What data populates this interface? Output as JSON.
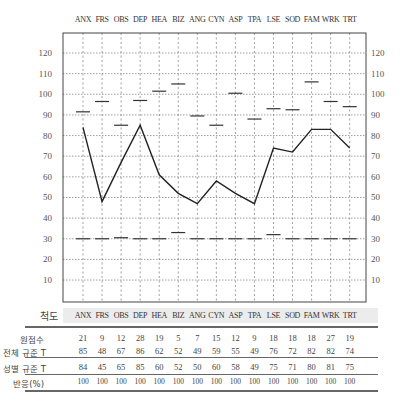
{
  "chart_data": {
    "type": "line",
    "title": "",
    "categories": [
      "ANX",
      "FRS",
      "OBS",
      "DEP",
      "HEA",
      "BIZ",
      "ANG",
      "CYN",
      "ASP",
      "TPA",
      "LSE",
      "SOD",
      "FAM",
      "WRK",
      "TRT"
    ],
    "ylim": [
      0,
      125
    ],
    "yticks": [
      10,
      20,
      30,
      40,
      50,
      60,
      70,
      80,
      90,
      100,
      110,
      120
    ],
    "grid": true,
    "series": [
      {
        "name": "profile line (T)",
        "style": "line",
        "values": [
          84,
          48,
          67,
          85,
          61,
          52,
          47,
          58,
          52,
          47,
          74,
          72,
          83,
          83,
          74
        ]
      },
      {
        "name": "upper markers",
        "style": "dash",
        "values": [
          91.5,
          96.5,
          85,
          97,
          101.5,
          105,
          89.5,
          85,
          100.5,
          88,
          93,
          92.5,
          106,
          96.5,
          94
        ]
      },
      {
        "name": "lower markers",
        "style": "dash",
        "values": [
          30,
          30,
          30.5,
          30,
          30,
          33,
          30,
          30,
          30,
          30,
          32,
          30,
          30,
          30,
          30
        ]
      }
    ]
  },
  "scale_row": {
    "label": "척도",
    "items": [
      "ANX",
      "FRS",
      "OBS",
      "DEP",
      "HEA",
      "BIZ",
      "ANG",
      "CYN",
      "ASP",
      "TPA",
      "LSE",
      "SOD",
      "FAM",
      "WRK",
      "TRT"
    ]
  },
  "table": {
    "rows": [
      {
        "label": "원점수",
        "values": [
          "21",
          "9",
          "12",
          "28",
          "19",
          "5",
          "7",
          "15",
          "12",
          "9",
          "18",
          "18",
          "18",
          "27",
          "19"
        ]
      },
      {
        "label": "전체 규준 T",
        "values": [
          "85",
          "48",
          "67",
          "86",
          "62",
          "52",
          "49",
          "59",
          "55",
          "49",
          "76",
          "72",
          "82",
          "82",
          "74"
        ]
      },
      {
        "label": "성별 규준 T",
        "values": [
          "84",
          "45",
          "65",
          "85",
          "60",
          "52",
          "50",
          "60",
          "58",
          "49",
          "75",
          "71",
          "80",
          "81",
          "75"
        ]
      },
      {
        "label": "반응(%)",
        "values": [
          "100",
          "100",
          "100",
          "100",
          "100",
          "100",
          "100",
          "100",
          "100",
          "100",
          "100",
          "100",
          "100",
          "100",
          "100"
        ]
      }
    ]
  },
  "colors": {
    "line": "#222222",
    "grid": "#777777",
    "frame": "#444444",
    "band": "#ececec",
    "text": "#444444"
  }
}
